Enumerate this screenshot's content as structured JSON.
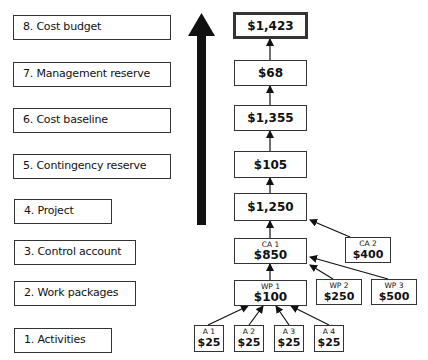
{
  "levels": [
    {
      "label": "8. Cost budget"
    },
    {
      "label": "7. Management reserve"
    },
    {
      "label": "6. Cost baseline"
    },
    {
      "label": "5. Contingency reserve"
    },
    {
      "label": "4. Project"
    },
    {
      "label": "3. Control account"
    },
    {
      "label": "2. Work packages"
    },
    {
      "label": "1. Activities"
    }
  ],
  "stack": {
    "cost_budget": "$1,423",
    "management_reserve": "$68",
    "cost_baseline": "$1,355",
    "contingency_reserve": "$105",
    "project": "$1,250"
  },
  "control_accounts": [
    {
      "name": "CA 1",
      "value": "$850"
    },
    {
      "name": "CA 2",
      "value": "$400"
    }
  ],
  "work_packages": [
    {
      "name": "WP 1",
      "value": "$100"
    },
    {
      "name": "WP 2",
      "value": "$250"
    },
    {
      "name": "WP 3",
      "value": "$500"
    }
  ],
  "activities": [
    {
      "name": "A 1",
      "value": "$25"
    },
    {
      "name": "A 2",
      "value": "$25"
    },
    {
      "name": "A 3",
      "value": "$25"
    },
    {
      "name": "A 4",
      "value": "$25"
    }
  ],
  "colors": {
    "line": "#111111",
    "box_border": "#333333",
    "background": "#ffffff"
  }
}
